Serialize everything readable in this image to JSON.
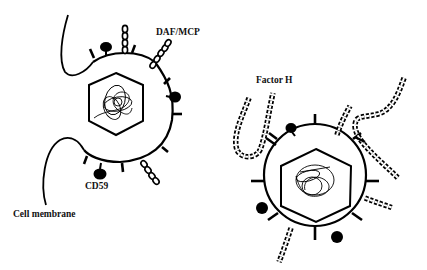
{
  "diagram": {
    "labels": {
      "daf_mcp": "DAF/MCP",
      "cd59": "CD59",
      "cell_membrane": "Cell membrane",
      "factor_h": "Factor H"
    },
    "colors": {
      "stroke": "#000000",
      "background": "#ffffff",
      "text": "#111111"
    },
    "elements": [
      {
        "name": "virion-left",
        "type": "enveloped virus budding from cell membrane",
        "features": [
          "hexagonal capsid",
          "genome coil",
          "spikes",
          "DAF/MCP beaded chains",
          "CD59 globular proteins"
        ]
      },
      {
        "name": "virion-right",
        "type": "enveloped virus",
        "features": [
          "hexagonal capsid",
          "genome coil",
          "spikes",
          "Factor H beaded chains",
          "globular proteins"
        ]
      }
    ]
  }
}
